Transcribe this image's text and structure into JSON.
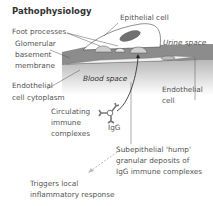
{
  "title": "Pathophysiology",
  "labels": {
    "foot_processes": "Foot processes",
    "gbm_1": "Glomerular",
    "gbm_2": "basement",
    "gbm_3": "membrane",
    "endo_cyto_1": "Endothelial",
    "endo_cyto_2": "cell cytoplasm",
    "epithelial_cell": "Epithelial cell",
    "urine_space": "Urine space",
    "blood_space": "Blood space",
    "endothelial_cell_1": "Endothelial",
    "endothelial_cell_2": "cell",
    "circulating_1": "Circulating",
    "circulating_2": "immune",
    "circulating_3": "complexes",
    "igg": "IgG",
    "deposits_1": "Subepithelial 'hump'",
    "deposits_2": "granular deposits of",
    "deposits_3": "IgG immune complexes",
    "triggers_1": "Triggers local",
    "triggers_2": "inflammatory response"
  },
  "colors": {
    "membrane": "#8a8a8a",
    "blood_gradient_top": "#bdbdbd",
    "blood_gradient_bottom": "#ffffff",
    "nucleus": "#6e6e6e",
    "arrow": "#222222",
    "dashed_arrow": "#bbbbbb"
  }
}
